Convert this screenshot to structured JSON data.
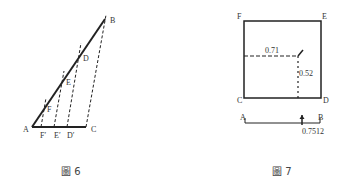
{
  "figures": [
    {
      "caption": "圖 6",
      "points": {
        "A": "A",
        "B": "B",
        "C": "C",
        "D": "D",
        "E": "E",
        "F": "F",
        "D_prime": "D′",
        "E_prime": "E′",
        "F_prime": "F′"
      }
    },
    {
      "caption": "圖 7",
      "points": {
        "A": "A",
        "B": "B",
        "C": "C",
        "D": "D",
        "E": "E",
        "F": "F"
      },
      "values": {
        "horizontal": "0.71",
        "vertical": "0.52",
        "result": "0.7512"
      }
    }
  ],
  "colors": {
    "line": "#222222",
    "background": "#ffffff"
  }
}
